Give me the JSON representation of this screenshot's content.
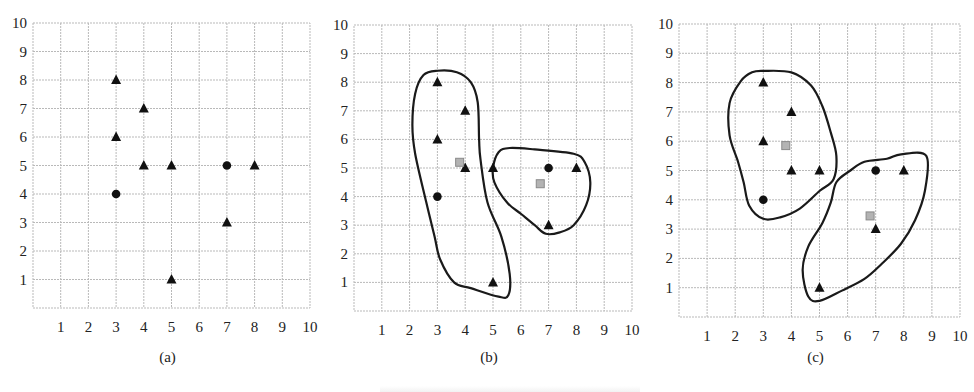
{
  "figure": {
    "colors": {
      "marker": "#111111",
      "centroid_fill": "#b3b3b3",
      "centroid_stroke": "#8a8a8a",
      "grid": "#b9b9b9",
      "contour": "#1a1a1a"
    }
  },
  "chart_data": [
    {
      "type": "scatter",
      "panel_label": "(a)",
      "title": "",
      "xlabel": "",
      "ylabel": "",
      "xlim": [
        0,
        10
      ],
      "ylim": [
        0,
        10
      ],
      "x_ticks": [
        "1",
        "2",
        "3",
        "4",
        "5",
        "6",
        "7",
        "8",
        "9",
        "10"
      ],
      "y_ticks": [
        "1",
        "2",
        "3",
        "4",
        "5",
        "6",
        "7",
        "8",
        "9",
        "10"
      ],
      "grid": true,
      "pixel_box": {
        "left": 33,
        "top": 23,
        "right": 310,
        "bottom": 308
      },
      "series": [
        {
          "name": "triangle",
          "marker": "triangle",
          "points": [
            [
              3,
              8
            ],
            [
              4,
              7
            ],
            [
              3,
              6
            ],
            [
              4,
              5
            ],
            [
              5,
              5
            ],
            [
              8,
              5
            ],
            [
              7,
              3
            ],
            [
              5,
              1
            ]
          ]
        },
        {
          "name": "circle",
          "marker": "circle",
          "points": [
            [
              3,
              4
            ],
            [
              7,
              5
            ]
          ]
        }
      ],
      "centroids": [],
      "clusters": []
    },
    {
      "type": "scatter",
      "panel_label": "(b)",
      "title": "",
      "xlabel": "",
      "ylabel": "",
      "xlim": [
        0,
        10
      ],
      "ylim": [
        0,
        10
      ],
      "x_ticks": [
        "1",
        "2",
        "3",
        "4",
        "5",
        "6",
        "7",
        "8",
        "9",
        "10"
      ],
      "y_ticks": [
        "1",
        "2",
        "3",
        "4",
        "5",
        "6",
        "7",
        "8",
        "9",
        "10"
      ],
      "grid": true,
      "pixel_box": {
        "left": 354,
        "top": 25,
        "right": 632,
        "bottom": 311
      },
      "series": [
        {
          "name": "triangle",
          "marker": "triangle",
          "points": [
            [
              3,
              8
            ],
            [
              4,
              7
            ],
            [
              3,
              6
            ],
            [
              4,
              5
            ],
            [
              5,
              5
            ],
            [
              8,
              5
            ],
            [
              7,
              3
            ],
            [
              5,
              1
            ]
          ]
        },
        {
          "name": "circle",
          "marker": "circle",
          "points": [
            [
              3,
              4
            ],
            [
              7,
              5
            ]
          ]
        }
      ],
      "centroids": [
        [
          3.8,
          5.2
        ],
        [
          6.7,
          4.45
        ]
      ],
      "clusters": [
        {
          "name": "cluster-1",
          "outline": [
            [
              3.0,
              8.4
            ],
            [
              3.7,
              8.35
            ],
            [
              4.2,
              8.0
            ],
            [
              4.45,
              7.3
            ],
            [
              4.5,
              6.0
            ],
            [
              4.55,
              5.3
            ],
            [
              4.8,
              3.8
            ],
            [
              5.3,
              2.6
            ],
            [
              5.6,
              1.3
            ],
            [
              5.55,
              0.55
            ],
            [
              5.2,
              0.5
            ],
            [
              4.2,
              0.8
            ],
            [
              3.6,
              1.0
            ],
            [
              3.1,
              1.8
            ],
            [
              2.9,
              2.6
            ],
            [
              2.6,
              3.8
            ],
            [
              2.2,
              5.5
            ],
            [
              2.1,
              6.5
            ],
            [
              2.2,
              7.6
            ],
            [
              2.5,
              8.25
            ]
          ]
        },
        {
          "name": "cluster-2",
          "outline": [
            [
              5.0,
              5.0
            ],
            [
              5.2,
              5.55
            ],
            [
              5.6,
              5.7
            ],
            [
              6.5,
              5.65
            ],
            [
              7.9,
              5.5
            ],
            [
              8.3,
              5.2
            ],
            [
              8.5,
              4.5
            ],
            [
              8.35,
              3.7
            ],
            [
              7.9,
              3.0
            ],
            [
              7.4,
              2.75
            ],
            [
              6.9,
              2.7
            ],
            [
              6.5,
              3.0
            ],
            [
              6.0,
              3.4
            ],
            [
              5.5,
              3.8
            ],
            [
              5.05,
              4.5
            ]
          ]
        }
      ]
    },
    {
      "type": "scatter",
      "panel_label": "(c)",
      "title": "",
      "xlabel": "",
      "ylabel": "",
      "xlim": [
        0,
        10
      ],
      "ylim": [
        0,
        10
      ],
      "x_ticks": [
        "1",
        "2",
        "3",
        "4",
        "5",
        "6",
        "7",
        "8",
        "9",
        "10"
      ],
      "y_ticks": [
        "1",
        "2",
        "3",
        "4",
        "5",
        "6",
        "7",
        "8",
        "9",
        "10"
      ],
      "grid": true,
      "pixel_box": {
        "left": 679,
        "top": 24,
        "right": 960,
        "bottom": 317
      },
      "series": [
        {
          "name": "triangle",
          "marker": "triangle",
          "points": [
            [
              3,
              8
            ],
            [
              4,
              7
            ],
            [
              3,
              6
            ],
            [
              4,
              5
            ],
            [
              5,
              5
            ],
            [
              8,
              5
            ],
            [
              7,
              3
            ],
            [
              5,
              1
            ]
          ]
        },
        {
          "name": "circle",
          "marker": "circle",
          "points": [
            [
              3,
              4
            ],
            [
              7,
              5
            ]
          ]
        }
      ],
      "centroids": [
        [
          3.8,
          5.85
        ],
        [
          6.8,
          3.45
        ]
      ],
      "clusters": [
        {
          "name": "cluster-1",
          "outline": [
            [
              3.0,
              8.4
            ],
            [
              4.0,
              8.35
            ],
            [
              4.7,
              7.9
            ],
            [
              5.1,
              7.2
            ],
            [
              5.4,
              6.3
            ],
            [
              5.6,
              5.5
            ],
            [
              5.5,
              4.7
            ],
            [
              5.0,
              4.3
            ],
            [
              4.3,
              3.7
            ],
            [
              3.6,
              3.4
            ],
            [
              3.0,
              3.35
            ],
            [
              2.5,
              3.8
            ],
            [
              2.3,
              4.6
            ],
            [
              2.1,
              5.3
            ],
            [
              1.8,
              6.2
            ],
            [
              1.8,
              7.3
            ],
            [
              2.2,
              8.05
            ],
            [
              2.6,
              8.35
            ]
          ]
        },
        {
          "name": "cluster-2",
          "outline": [
            [
              5.6,
              4.6
            ],
            [
              6.1,
              5.0
            ],
            [
              6.6,
              5.3
            ],
            [
              7.4,
              5.4
            ],
            [
              7.9,
              5.55
            ],
            [
              8.8,
              5.5
            ],
            [
              8.75,
              4.3
            ],
            [
              8.4,
              3.3
            ],
            [
              7.9,
              2.5
            ],
            [
              7.2,
              1.8
            ],
            [
              6.6,
              1.3
            ],
            [
              5.8,
              0.9
            ],
            [
              5.0,
              0.55
            ],
            [
              4.6,
              0.7
            ],
            [
              4.4,
              1.6
            ],
            [
              4.6,
              2.4
            ],
            [
              5.1,
              3.2
            ],
            [
              5.4,
              3.9
            ]
          ]
        }
      ]
    }
  ]
}
